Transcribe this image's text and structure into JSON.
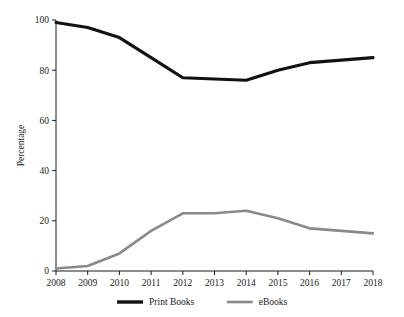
{
  "chart_data": {
    "type": "line",
    "title": "",
    "subtitle": "",
    "xlabel": "",
    "ylabel": "Percentage",
    "categories": [
      "2008",
      "2009",
      "2010",
      "2011",
      "2012",
      "2013",
      "2014",
      "2015",
      "2016",
      "2017",
      "2018"
    ],
    "x": [
      2008,
      2009,
      2010,
      2011,
      2012,
      2013,
      2014,
      2015,
      2016,
      2017,
      2018
    ],
    "series": [
      {
        "name": "Print Books",
        "color": "#111111",
        "line_width": 3.1,
        "values": [
          99,
          97,
          93,
          85,
          77,
          76.5,
          76,
          80,
          83,
          84,
          85
        ]
      },
      {
        "name": "eBooks",
        "color": "#8a8a8a",
        "line_width": 2.6,
        "values": [
          1,
          2,
          7,
          16,
          23,
          23,
          24,
          21,
          17,
          16,
          15
        ]
      }
    ],
    "ylim": [
      0,
      100
    ],
    "yticks": [
      0,
      20,
      40,
      60,
      80,
      100
    ],
    "ytick_labels": [
      "0",
      "20",
      "40",
      "60",
      "80",
      "100"
    ],
    "xlim": [
      2008,
      2018
    ],
    "grid": false,
    "legend_position": "bottom",
    "legend": [
      {
        "label": "Print Books",
        "color": "#111111",
        "line_width": 3.4
      },
      {
        "label": "eBooks",
        "color": "#8a8a8a",
        "line_width": 2.6
      }
    ]
  },
  "colors": {
    "background": "#ffffff",
    "axis": "#1a1a1a",
    "text": "#1a1a1a",
    "print_books": "#111111",
    "ebooks": "#8a8a8a"
  }
}
